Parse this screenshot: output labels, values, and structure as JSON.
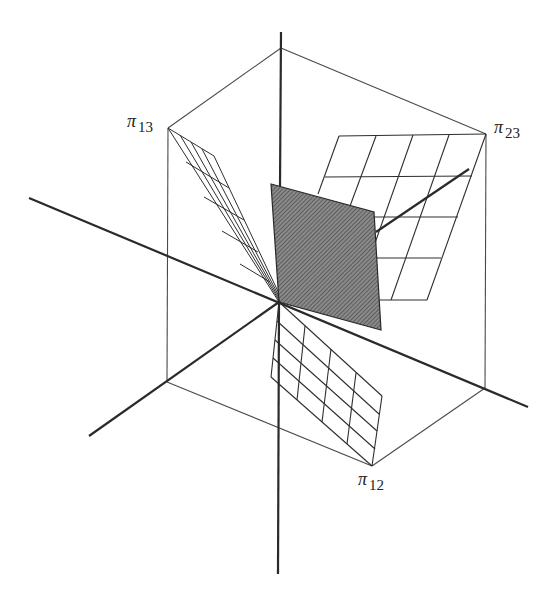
{
  "figure": {
    "colors": {
      "background": "#ffffff",
      "axis": "#2a2a2a",
      "box_edge": "#4a4a4a",
      "grid": "#2e2e2e",
      "shaded_plane": "#6e6e6e"
    },
    "labels": {
      "pi13": {
        "symbol": "π",
        "subscript": "13"
      },
      "pi23": {
        "symbol": "π",
        "subscript": "23"
      },
      "pi12": {
        "symbol": "π",
        "subscript": "12"
      }
    }
  }
}
